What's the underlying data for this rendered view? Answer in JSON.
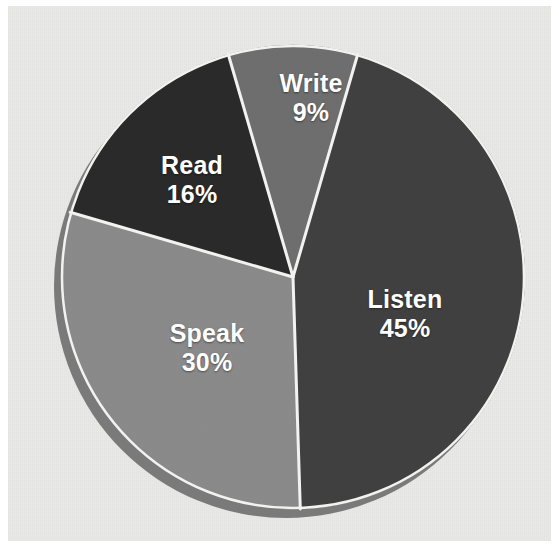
{
  "page": {
    "background_color": "#ffffff",
    "panel_color": "#e9e9e7"
  },
  "chart_data": {
    "type": "pie",
    "title": "",
    "subtitle": "",
    "xlabel": "",
    "ylabel": "",
    "grid": false,
    "legend_position": "none",
    "labels_inside_slices": true,
    "unit": "%",
    "total": 100,
    "categories": [
      "Write",
      "Listen",
      "Speak",
      "Read"
    ],
    "values": [
      9,
      45,
      30,
      16
    ],
    "slices": [
      {
        "name": "Write",
        "label": "Write",
        "value": 9,
        "value_label": "9%",
        "color": "#6f6f6f",
        "start_angle_deg": -16.2,
        "end_angle_deg": 16.2,
        "label_x": 311,
        "label_y": 98
      },
      {
        "name": "Listen",
        "label": "Listen",
        "value": 45,
        "value_label": "45%",
        "color": "#414141",
        "start_angle_deg": 16.2,
        "end_angle_deg": 178.2,
        "label_x": 405,
        "label_y": 314
      },
      {
        "name": "Speak",
        "label": "Speak",
        "value": 30,
        "value_label": "30%",
        "color": "#8b8b8b",
        "start_angle_deg": 178.2,
        "end_angle_deg": 286.2,
        "label_x": 207,
        "label_y": 348
      },
      {
        "name": "Read",
        "label": "Read",
        "value": 16,
        "value_label": "16%",
        "color": "#2b2b2b",
        "start_angle_deg": 286.2,
        "end_angle_deg": 343.8,
        "label_x": 192,
        "label_y": 180
      }
    ],
    "separator_color": "#f2f2f0",
    "depth_shadow_color": "#7a7a7a",
    "label_text_color": "#ffffff",
    "center_x": 293,
    "center_y": 277,
    "radius": 232
  }
}
